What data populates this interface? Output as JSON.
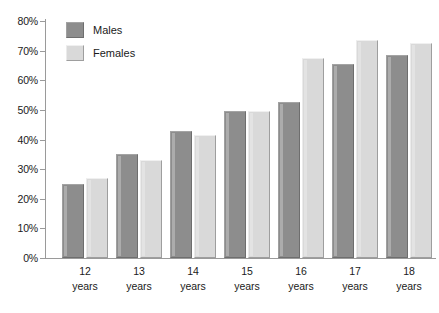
{
  "chart_data": {
    "type": "bar",
    "title": "",
    "subtitle": "",
    "xlabel": "",
    "ylabel": "",
    "ylim": [
      0,
      80
    ],
    "ytick_step": 10,
    "ytick_labels": [
      "80%",
      "70%",
      "60%",
      "50%",
      "40%",
      "30%",
      "20%",
      "10%",
      "0%"
    ],
    "ytick_values": [
      80,
      70,
      60,
      50,
      40,
      30,
      20,
      10,
      0
    ],
    "grid": false,
    "legend_position": "top-left-inside",
    "categories": [
      "12\nyears",
      "13\nyears",
      "14\nyears",
      "15\nyears",
      "16\nyears",
      "17\nyears",
      "18\nyears"
    ],
    "category_lines": [
      [
        "12",
        "years"
      ],
      [
        "13",
        "years"
      ],
      [
        "14",
        "years"
      ],
      [
        "15",
        "years"
      ],
      [
        "16",
        "years"
      ],
      [
        "17",
        "years"
      ],
      [
        "18",
        "years"
      ]
    ],
    "series": [
      {
        "name": "Males",
        "color": "#8d8d8d",
        "values": [
          25,
          35,
          43,
          49.5,
          52.5,
          65.5,
          68.5
        ]
      },
      {
        "name": "Females",
        "color": "#d9d9d9",
        "values": [
          27,
          33,
          41.5,
          49.5,
          67.5,
          73.5,
          72.5
        ]
      }
    ]
  },
  "legend": {
    "items": [
      {
        "label": "Males",
        "swatch": "male"
      },
      {
        "label": "Females",
        "swatch": "female"
      }
    ]
  },
  "artifact": {
    "bottom_text": ""
  }
}
